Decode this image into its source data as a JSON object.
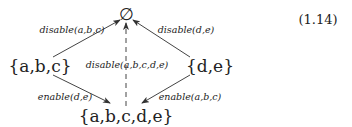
{
  "equation_number": "(1.14)",
  "nodes": {
    "top": "∅",
    "left": "{a,b,c}",
    "right": "{d,e}",
    "bottom": "{a,b,c,d,e}"
  },
  "edges": [
    {
      "from": "left",
      "to": "top",
      "label": "disable(a,b,c)",
      "style": "solid"
    },
    {
      "from": "right",
      "to": "top",
      "label": "disable(d,e)",
      "style": "solid"
    },
    {
      "from": "bottom",
      "to": "top",
      "label": "disable(a,b,c,d,e)",
      "style": "dashed"
    },
    {
      "from": "left",
      "to": "bottom",
      "label": "enable(d,e)",
      "style": "solid"
    },
    {
      "from": "right",
      "to": "bottom",
      "label": "enable(a,b,c)",
      "style": "solid"
    }
  ]
}
